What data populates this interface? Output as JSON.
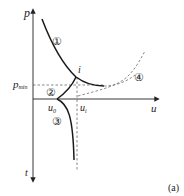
{
  "figure": {
    "panel_label": "(a)",
    "axes": {
      "vertical_up_label": "p",
      "vertical_down_label": "t",
      "horizontal_label": "u"
    },
    "markers": {
      "p_min_label": "p",
      "p_min_subscript": "min",
      "u0_label": "u",
      "u0_subscript": "0",
      "ui_label": "u",
      "ui_subscript": "i",
      "intersection_label": "i"
    },
    "regions": [
      {
        "id": "1",
        "symbol": "①"
      },
      {
        "id": "2",
        "symbol": "②"
      },
      {
        "id": "3",
        "symbol": "③"
      },
      {
        "id": "4",
        "symbol": "④"
      }
    ],
    "colors": {
      "line": "#1a1a1a",
      "dashed": "#555555"
    }
  }
}
